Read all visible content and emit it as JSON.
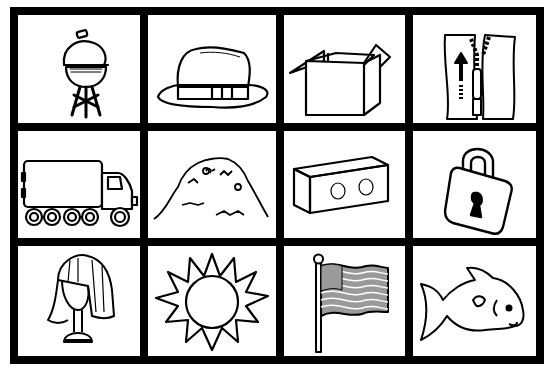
{
  "worksheet": {
    "colors": {
      "border": "#000000",
      "cell_background": "#ffffff",
      "line": "#000000",
      "flag_fill": "#9a9a9a"
    },
    "cells": [
      {
        "label": "grill",
        "icon": "grill-icon"
      },
      {
        "label": "hat",
        "icon": "hat-icon"
      },
      {
        "label": "box",
        "icon": "box-icon"
      },
      {
        "label": "zipper",
        "icon": "zipper-icon"
      },
      {
        "label": "truck",
        "icon": "truck-icon"
      },
      {
        "label": "hay",
        "icon": "hay-icon"
      },
      {
        "label": "block",
        "icon": "block-icon"
      },
      {
        "label": "lock",
        "icon": "lock-icon"
      },
      {
        "label": "wig",
        "icon": "wig-icon"
      },
      {
        "label": "sun",
        "icon": "sun-icon"
      },
      {
        "label": "flag",
        "icon": "flag-icon"
      },
      {
        "label": "fish",
        "icon": "fish-icon"
      }
    ]
  }
}
